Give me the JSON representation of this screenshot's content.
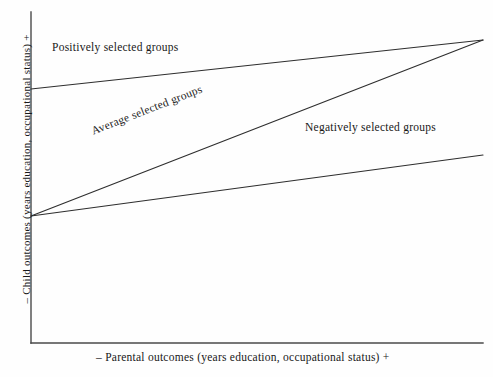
{
  "figure": {
    "background_color": "#fefefe",
    "line_color": "#2e2e2e",
    "axis_color": "#4a4a4a"
  },
  "axes": {
    "y_label": "– Child outcomes (years education, occupational status) +",
    "x_label": "– Parental outcomes (years education, occupational status) +"
  },
  "annotations": {
    "positive": "Positively selected groups",
    "average": "Average selected groups",
    "negative": "Negatively selected groups"
  },
  "chart_data": {
    "type": "line",
    "title": "",
    "xlabel": "– Parental outcomes (years education, occupational status) +",
    "ylabel": "– Child outcomes (years education, occupational status) +",
    "xlim": [
      0,
      1
    ],
    "ylim": [
      0,
      1
    ],
    "grid": false,
    "legend": "inline-annotations",
    "axis_ticks": "none",
    "note": "Schematic diagram: three intergenerational mobility slopes converging at the high-parental-outcome end.",
    "series": [
      {
        "name": "Positively selected groups",
        "x": [
          0,
          1
        ],
        "y": [
          0.767,
          0.915
        ],
        "pixel_points": [
          [
            31,
            89
          ],
          [
            483,
            40
          ]
        ],
        "slope_description": "high intercept, shallow positive slope"
      },
      {
        "name": "Average selected groups",
        "x": [
          0,
          1
        ],
        "y": [
          0.384,
          0.915
        ],
        "pixel_points": [
          [
            31,
            216
          ],
          [
            483,
            40
          ]
        ],
        "slope_description": "low intercept, steep positive slope"
      },
      {
        "name": "Negatively selected groups",
        "x": [
          0,
          1
        ],
        "y": [
          0.384,
          0.568
        ],
        "pixel_points": [
          [
            31,
            216
          ],
          [
            483,
            155
          ]
        ],
        "slope_description": "low intercept, shallow positive slope"
      }
    ]
  }
}
